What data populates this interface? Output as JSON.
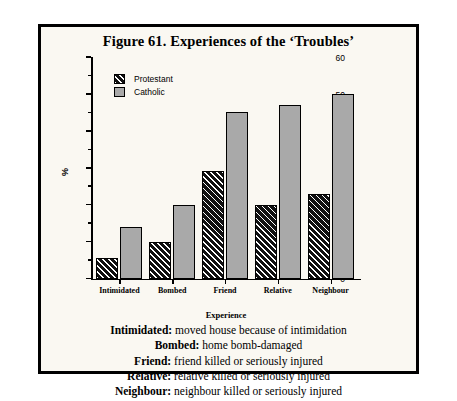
{
  "figure": {
    "title": "Figure 61. Experiences of the ‘Troubles’"
  },
  "legend": {
    "position": "top-left",
    "entries": [
      {
        "label": "Protestant",
        "swatch": "hatched-black-swatch",
        "color": "#111111"
      },
      {
        "label": "Catholic",
        "swatch": "gray-swatch",
        "color": "#a9a9a9"
      }
    ]
  },
  "footnotes": [
    {
      "term": "Intimidated:",
      "text": " moved house because of intimidation"
    },
    {
      "term": "Bombed:",
      "text": " home bomb-damaged"
    },
    {
      "term": "Friend:",
      "text": " friend killed or seriously injured"
    },
    {
      "term": "Relative:",
      "text": " relative killed or seriously injured"
    },
    {
      "term": "Neighbour:",
      "text": " neighbour killed or seriously injured"
    }
  ],
  "chart_data": {
    "type": "bar",
    "title": "Figure 61. Experiences of the ‘Troubles’",
    "xlabel": "Experience",
    "ylabel": "%",
    "ylim": [
      0,
      60
    ],
    "yticks": [
      0,
      10,
      20,
      30,
      40,
      50,
      60
    ],
    "ytick_labels": [
      "0",
      "10",
      "20",
      "30",
      "40",
      "50",
      "60"
    ],
    "yminor_ticks": [
      5,
      15,
      25,
      35,
      45,
      55
    ],
    "grid": false,
    "legend_position": "upper left",
    "categories": [
      "Intimidated",
      "Bombed",
      "Friend",
      "Relative",
      "Neighbour"
    ],
    "series": [
      {
        "name": "Protestant",
        "color": "#111111",
        "values": [
          5.5,
          10,
          29,
          20,
          23
        ]
      },
      {
        "name": "Catholic",
        "color": "#a9a9a9",
        "values": [
          14,
          20,
          45,
          47,
          50
        ]
      }
    ]
  }
}
